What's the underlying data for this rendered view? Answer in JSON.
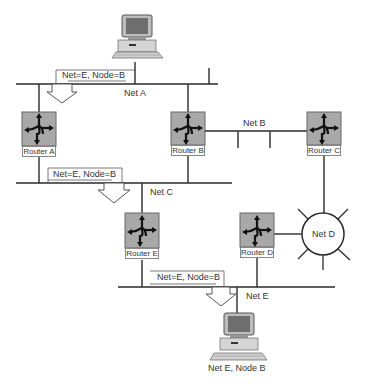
{
  "colors": {
    "line": "#2a2a2a",
    "router_fill": "#a8a8a8",
    "router_border": "#666666",
    "background": "#ffffff"
  },
  "networks": {
    "net_a": "Net A",
    "net_b": "Net B",
    "net_c": "Net C",
    "net_d": "Net D",
    "net_e": "Net E"
  },
  "routers": [
    {
      "id": "a",
      "label": "Router A"
    },
    {
      "id": "b",
      "label": "Router B"
    },
    {
      "id": "c",
      "label": "Router C"
    },
    {
      "id": "d",
      "label": "Router D"
    },
    {
      "id": "e",
      "label": "Router E"
    }
  ],
  "packets": [
    {
      "label": "Net=E, Node=B"
    },
    {
      "label": "Net=E, Node=B"
    },
    {
      "label": "Net=E, Node=B"
    }
  ],
  "hosts": {
    "source": {
      "label": ""
    },
    "destination": {
      "label": "Net E, Node B"
    }
  }
}
